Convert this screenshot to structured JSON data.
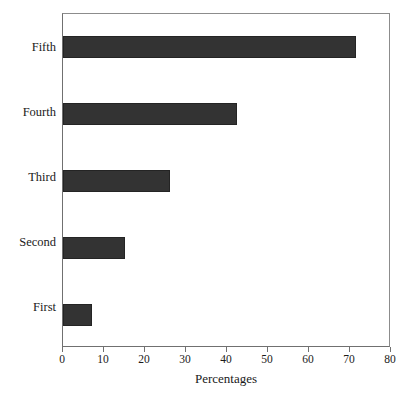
{
  "chart_data": {
    "type": "bar",
    "orientation": "horizontal",
    "title": "",
    "xlabel": "Percentages",
    "ylabel": "",
    "categories": [
      "First",
      "Second",
      "Third",
      "Fourth",
      "Fifth"
    ],
    "values": [
      7,
      15,
      26,
      42.5,
      71.5
    ],
    "xlim": [
      0,
      80
    ],
    "xticks": [
      0,
      10,
      20,
      30,
      40,
      50,
      60,
      70,
      80
    ],
    "xtick_labels": [
      "0",
      "10",
      "20",
      "30",
      "40",
      "50",
      "60",
      "70",
      "80"
    ],
    "grid": false,
    "legend": false,
    "bar_color": "#333333",
    "bar_edge_color": "#242424",
    "frame_color": "#8c8c8c",
    "background_color": "#ffffff",
    "category_order_top_to_bottom": [
      "Fifth",
      "Fourth",
      "Third",
      "Second",
      "First"
    ]
  },
  "axis": {
    "x_title": "Percentages"
  }
}
